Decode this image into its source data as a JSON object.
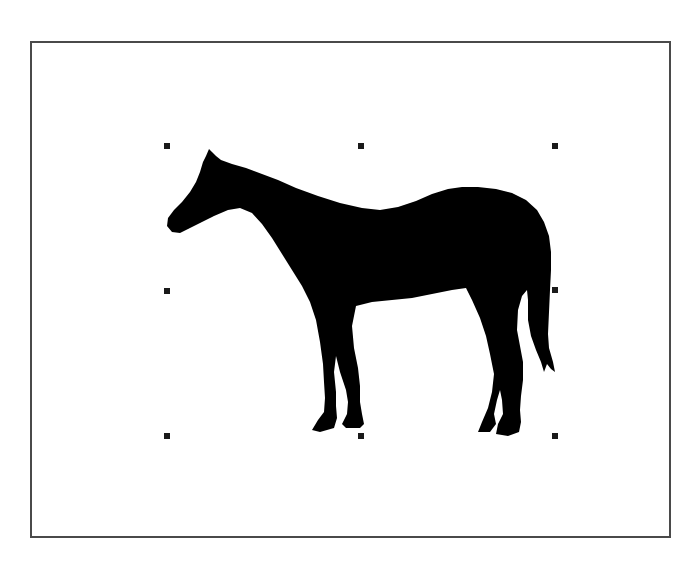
{
  "canvas": {
    "frame_color": "#4a4a4a",
    "background": "#ffffff"
  },
  "graphic": {
    "type": "clip-art",
    "subject": "horse-silhouette",
    "fill": "#000000",
    "selected": true,
    "bounds": {
      "left": 167,
      "top": 146,
      "right": 555,
      "bottom": 435
    }
  },
  "selection": {
    "handle_color": "#1a1a1a",
    "handle_size": 6,
    "handles": [
      {
        "id": "nw",
        "x": 164,
        "y": 143
      },
      {
        "id": "n",
        "x": 358,
        "y": 143
      },
      {
        "id": "ne",
        "x": 552,
        "y": 143
      },
      {
        "id": "w",
        "x": 164,
        "y": 288
      },
      {
        "id": "e",
        "x": 552,
        "y": 287
      },
      {
        "id": "sw",
        "x": 164,
        "y": 433
      },
      {
        "id": "s",
        "x": 358,
        "y": 433
      },
      {
        "id": "se",
        "x": 552,
        "y": 433
      }
    ]
  }
}
